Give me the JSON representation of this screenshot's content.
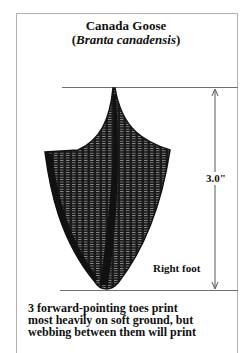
{
  "figure": {
    "title": "Canada Goose",
    "scientific_name_open": "(",
    "scientific_name": "Branta canadensis",
    "scientific_name_close": ")",
    "measurement_label": "3.0\"",
    "foot_label": "Right foot",
    "description_lines": [
      "3 forward-pointing toes print",
      "most heavily on soft ground, but",
      "webbing between them will print"
    ],
    "colors": {
      "ink": "#111111",
      "frame": "#b0b0b0",
      "guide_lines": "#707070"
    }
  }
}
